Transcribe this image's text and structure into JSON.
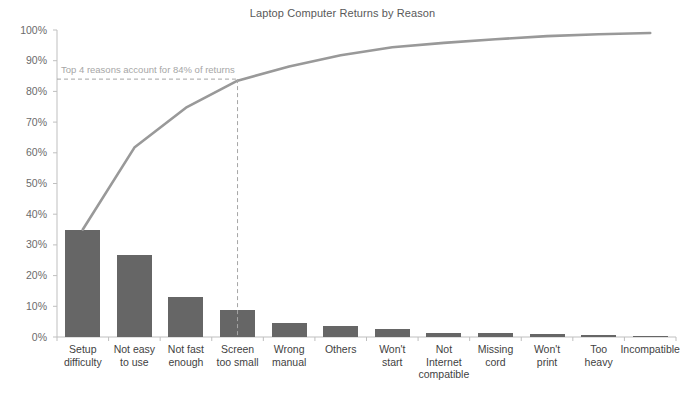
{
  "chart_data": {
    "type": "bar",
    "title": "Laptop Computer Returns by Reason",
    "xlabel": "",
    "ylabel": "",
    "ylim": [
      0,
      100
    ],
    "grid": false,
    "legend": "none",
    "categories": [
      "Setup difficulty",
      "Not easy to use",
      "Not fast enough",
      "Screen too small",
      "Wrong manual",
      "Others",
      "Won't start",
      "Not Internet compatible",
      "Missing cord",
      "Won't print",
      "Too heavy",
      "Incompatible"
    ],
    "category_lines": [
      [
        "Setup",
        "difficulty"
      ],
      [
        "Not easy",
        "to use"
      ],
      [
        "Not fast",
        "enough"
      ],
      [
        "Screen",
        "too small"
      ],
      [
        "Wrong",
        "manual"
      ],
      [
        "Others"
      ],
      [
        "Won't",
        "start"
      ],
      [
        "Not",
        "Internet",
        "compatible"
      ],
      [
        "Missing",
        "cord"
      ],
      [
        "Won't",
        "print"
      ],
      [
        "Too",
        "heavy"
      ],
      [
        "Incompatible"
      ]
    ],
    "series": [
      {
        "name": "Percent of returns",
        "type": "bar",
        "values": [
          35.0,
          26.7,
          13.0,
          8.8,
          4.6,
          3.7,
          2.6,
          1.4,
          1.2,
          1.0,
          0.6,
          0.4
        ],
        "color": "#666666"
      },
      {
        "name": "Cumulative percent",
        "type": "line",
        "values": [
          35.0,
          61.7,
          74.7,
          83.5,
          88.1,
          91.8,
          94.4,
          95.8,
          97.0,
          98.0,
          98.6,
          99.0
        ],
        "color": "#999999"
      }
    ],
    "ytick_labels": [
      "0%",
      "10%",
      "20%",
      "30%",
      "40%",
      "50%",
      "60%",
      "70%",
      "80%",
      "90%",
      "100%"
    ],
    "ytick_values": [
      0,
      10,
      20,
      30,
      40,
      50,
      60,
      70,
      80,
      90,
      100
    ],
    "annotations": [
      {
        "text": "Top 4 reasons account for 84% of returns",
        "value": 84,
        "marker_category": "Screen too small",
        "color": "#a6a6a6"
      }
    ]
  },
  "colors": {
    "bar": "#666666",
    "line": "#999999",
    "axis": "#bfbfbf",
    "annotation": "#a6a6a6",
    "title_text": "#595959",
    "tick_text": "#6b6b6b",
    "background": "#ffffff"
  }
}
